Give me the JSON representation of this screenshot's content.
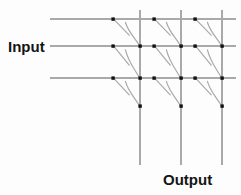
{
  "figure": {
    "kind": "crossbar-switch-matrix",
    "title": "",
    "background_color": "#fdfdfd",
    "line_color": "#a9a9a9",
    "dot_color": "#111111",
    "label_color": "#141414"
  },
  "labels": {
    "input": "Input",
    "output": "Output"
  },
  "chart_data": {
    "type": "diagram",
    "title": "",
    "xlabel": "Output",
    "ylabel": "Input",
    "rows": 3,
    "columns": 3,
    "horizontal_lines": [
      {
        "name": "input-line-1",
        "y": 19,
        "x_start": 50,
        "x_end": 236
      },
      {
        "name": "input-line-2",
        "y": 46,
        "x_start": 50,
        "x_end": 236
      },
      {
        "name": "input-line-3",
        "y": 78,
        "x_start": 50,
        "x_end": 236
      }
    ],
    "vertical_lines": [
      {
        "name": "output-line-1",
        "x": 140,
        "y_start": 10,
        "y_end": 165
      },
      {
        "name": "output-line-2",
        "x": 181,
        "y_start": 10,
        "y_end": 165
      },
      {
        "name": "output-line-3",
        "x": 222,
        "y_start": 10,
        "y_end": 165
      }
    ],
    "switches": [
      {
        "row": 1,
        "col": 1,
        "source_dot": [
          113,
          19
        ],
        "target_dot": [
          140,
          46
        ]
      },
      {
        "row": 1,
        "col": 2,
        "source_dot": [
          154,
          19
        ],
        "target_dot": [
          181,
          46
        ]
      },
      {
        "row": 1,
        "col": 3,
        "source_dot": [
          195,
          19
        ],
        "target_dot": [
          222,
          46
        ]
      },
      {
        "row": 2,
        "col": 1,
        "source_dot": [
          113,
          46
        ],
        "target_dot": [
          140,
          78
        ]
      },
      {
        "row": 2,
        "col": 2,
        "source_dot": [
          154,
          46
        ],
        "target_dot": [
          181,
          78
        ]
      },
      {
        "row": 2,
        "col": 3,
        "source_dot": [
          195,
          46
        ],
        "target_dot": [
          222,
          78
        ]
      },
      {
        "row": 3,
        "col": 1,
        "source_dot": [
          113,
          78
        ],
        "target_dot": [
          140,
          106
        ]
      },
      {
        "row": 3,
        "col": 2,
        "source_dot": [
          154,
          78
        ],
        "target_dot": [
          181,
          106
        ]
      },
      {
        "row": 3,
        "col": 3,
        "source_dot": [
          195,
          78
        ],
        "target_dot": [
          222,
          106
        ]
      }
    ],
    "grid": false,
    "legend": null
  }
}
